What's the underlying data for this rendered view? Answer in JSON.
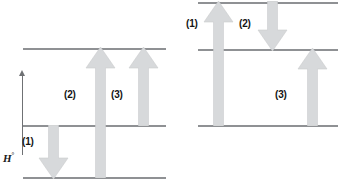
{
  "figure": {
    "type": "energy-level-diagram",
    "axis": {
      "label_symbol": "H",
      "label_superscript": "°",
      "label_full": "H°",
      "direction": "up",
      "name": "enthalpy-axis"
    },
    "colors": {
      "level_line": "#8f9194",
      "arrow_fill": "#d7d9db",
      "arrow_stroke": "#c9cbcd",
      "label_text": "#141414",
      "axis": "#6f7174",
      "background": "#ffffff"
    },
    "panels": [
      {
        "id": "left",
        "name": "left-energy-diagram",
        "levels": [
          {
            "name": "top-level",
            "position": "top"
          },
          {
            "name": "middle-level",
            "position": "middle"
          },
          {
            "name": "bottom-level",
            "position": "bottom"
          }
        ],
        "arrows": [
          {
            "id": "1",
            "label": "(1)",
            "direction": "down",
            "from": "middle",
            "to": "bottom"
          },
          {
            "id": "2",
            "label": "(2)",
            "direction": "up",
            "from": "bottom",
            "to": "top"
          },
          {
            "id": "3",
            "label": "(3)",
            "direction": "up",
            "from": "middle",
            "to": "top"
          }
        ],
        "visible_labels": [
          "(1)",
          "(2)",
          "(3)"
        ]
      },
      {
        "id": "right",
        "name": "right-energy-diagram",
        "levels": [
          {
            "name": "top-level",
            "position": "top"
          },
          {
            "name": "middle-level",
            "position": "middle"
          },
          {
            "name": "bottom-level",
            "position": "bottom"
          }
        ],
        "arrows": [
          {
            "id": "1",
            "label": "(1)",
            "direction": "up",
            "from": "middle",
            "to": "top"
          },
          {
            "id": "2",
            "label": "(2)",
            "direction": "down",
            "from": "top",
            "to": "middle"
          },
          {
            "id": "3",
            "label": "(3)",
            "direction": "up",
            "from": "bottom",
            "to": "middle"
          }
        ],
        "visible_labels": [
          "(1)",
          "(2)",
          "(3)"
        ]
      }
    ]
  }
}
